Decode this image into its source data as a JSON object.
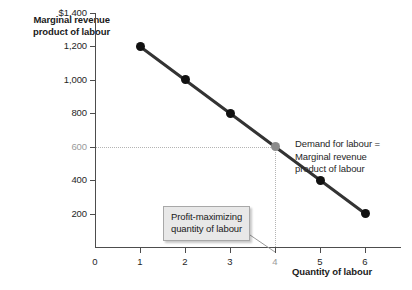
{
  "chart_data": {
    "type": "line",
    "title": "",
    "xlabel": "Quantity of labour",
    "ylabel": "Marginal revenue product of labour",
    "x": [
      1,
      2,
      3,
      4,
      5,
      6
    ],
    "values": [
      1200,
      1000,
      800,
      600,
      400,
      200
    ],
    "series": [
      {
        "name": "Demand for labour = Marginal revenue product of labour",
        "values": [
          1200,
          1000,
          800,
          600,
          400,
          200
        ]
      }
    ],
    "xlim": [
      0,
      6.8
    ],
    "ylim": [
      0,
      1400
    ],
    "x_ticks": [
      "0",
      "1",
      "2",
      "3",
      "4",
      "5",
      "6"
    ],
    "y_ticks": [
      "$1,400",
      "1,200",
      "1,000",
      "800",
      "600",
      "400",
      "200"
    ],
    "grid": false,
    "legend_position": "inline-right",
    "highlight_point": {
      "x": 4,
      "y": 600
    },
    "annotations": [
      "Demand for labour = Marginal revenue product of labour",
      "Profit-maximizing quantity of labour"
    ],
    "colors": {
      "line": "#333333",
      "marker": "#111111",
      "highlight_marker": "#8c8c8c",
      "axis": "#4d4d4d",
      "guide": "#b4b4b4",
      "callout_fill": "#e8e8e8",
      "callout_border": "#a8a8a8",
      "text": "#262626",
      "muted_text": "#9a9a9a"
    }
  },
  "axes": {
    "y_title_line1": "Marginal revenue",
    "y_title_line2": "product of labour",
    "x_title": "Quantity of labour"
  },
  "y_ticks": [
    {
      "label": "$1,400",
      "muted": false
    },
    {
      "label": "1,200",
      "muted": false
    },
    {
      "label": "1,000",
      "muted": false
    },
    {
      "label": "800",
      "muted": false
    },
    {
      "label": "600",
      "muted": true
    },
    {
      "label": "400",
      "muted": false
    },
    {
      "label": "200",
      "muted": false
    }
  ],
  "x_ticks": [
    {
      "label": "0",
      "muted": false
    },
    {
      "label": "1",
      "muted": false
    },
    {
      "label": "2",
      "muted": false
    },
    {
      "label": "3",
      "muted": false
    },
    {
      "label": "4",
      "muted": true
    },
    {
      "label": "5",
      "muted": false
    },
    {
      "label": "6",
      "muted": false
    }
  ],
  "series_note": {
    "line1": "Demand for labour =",
    "line2": "Marginal revenue",
    "line3": "product of labour"
  },
  "callout": {
    "line1": "Profit-maximizing",
    "line2": "quantity of labour"
  }
}
